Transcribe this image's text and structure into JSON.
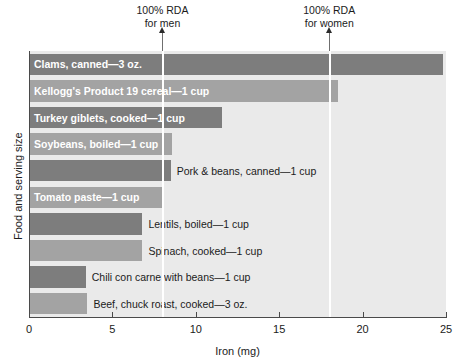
{
  "chart_data": {
    "type": "bar",
    "orientation": "horizontal",
    "title": "",
    "xlabel": "Iron (mg)",
    "ylabel": "Food and serving size",
    "xlim": [
      0,
      25
    ],
    "xticks": [
      0,
      5,
      10,
      15,
      20,
      25
    ],
    "xticklabels": [
      "0",
      "5",
      "10",
      "15",
      "20",
      "25"
    ],
    "grid": false,
    "legend": null,
    "categories": [
      "Clams, canned—3 oz.",
      "Kellogg's Product 19 cereal—1 cup",
      "Turkey giblets, cooked—1 cup",
      "Soybeans, boiled—1 cup",
      "Pork & beans, canned—1 cup",
      "Tomato paste—1 cup",
      "Lentils, boiled—1 cup",
      "Spinach, cooked—1 cup",
      "Chili con carne with beans—1 cup",
      "Beef, chuck roast, cooked—3 oz."
    ],
    "values": [
      24.8,
      18.5,
      11.6,
      8.6,
      8.5,
      8.1,
      6.8,
      6.8,
      3.4,
      3.5
    ],
    "annotations": [
      {
        "label_line1": "100% RDA",
        "label_line2": "for men",
        "x": 8
      },
      {
        "label_line1": "100% RDA",
        "label_line2": "for women",
        "x": 18
      }
    ],
    "colors": {
      "plot_background": "#eaeaea",
      "bar_dark": "#7d7d7d",
      "bar_light": "#a3a3a3",
      "axis": "#4a4a4a",
      "text": "#1b1b1b",
      "label_inside": "#ffffff",
      "rda_rule": "#ffffff"
    }
  },
  "bars": [
    {
      "label": "Clams, canned—3 oz.",
      "value": 24.8,
      "shade": "dark",
      "label_position": "inside"
    },
    {
      "label": "Kellogg's Product 19 cereal—1 cup",
      "value": 18.5,
      "shade": "light",
      "label_position": "inside"
    },
    {
      "label": "Turkey giblets, cooked—1 cup",
      "value": 11.6,
      "shade": "dark",
      "label_position": "inside"
    },
    {
      "label": "Soybeans, boiled—1 cup",
      "value": 8.6,
      "shade": "light",
      "label_position": "inside"
    },
    {
      "label": "Pork & beans, canned—1 cup",
      "value": 8.5,
      "shade": "dark",
      "label_position": "outside"
    },
    {
      "label": "Tomato paste—1 cup",
      "value": 8.1,
      "shade": "light",
      "label_position": "inside"
    },
    {
      "label": "Lentils, boiled—1 cup",
      "value": 6.8,
      "shade": "dark",
      "label_position": "outside"
    },
    {
      "label": "Spinach, cooked—1 cup",
      "value": 6.8,
      "shade": "light",
      "label_position": "outside"
    },
    {
      "label": "Chili con carne with beans—1 cup",
      "value": 3.4,
      "shade": "dark",
      "label_position": "outside"
    },
    {
      "label": "Beef, chuck roast, cooked—3 oz.",
      "value": 3.5,
      "shade": "light",
      "label_position": "outside"
    }
  ],
  "axes": {
    "x_title": "Iron (mg)",
    "y_title": "Food and serving size",
    "x_tick_labels": [
      "0",
      "5",
      "10",
      "15",
      "20",
      "25"
    ]
  },
  "rda": {
    "men": {
      "line1": "100% RDA",
      "line2": "for men"
    },
    "women": {
      "line1": "100% RDA",
      "line2": "for women"
    }
  }
}
